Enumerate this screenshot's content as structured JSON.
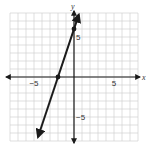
{
  "chart_data": {
    "type": "line",
    "title": "",
    "xlabel": "x",
    "ylabel": "y",
    "xlim": [
      -8,
      8
    ],
    "ylim": [
      -8,
      8
    ],
    "grid": true,
    "grid_step": 1,
    "x_tick_labels": [
      {
        "value": -5,
        "label": "−5"
      },
      {
        "value": 5,
        "label": "5"
      }
    ],
    "y_tick_labels": [
      {
        "value": 5,
        "label": "5"
      },
      {
        "value": -5,
        "label": "−5"
      }
    ],
    "series": [
      {
        "name": "line",
        "equation": "y = 3x + 6",
        "slope": 3,
        "intercept": 6,
        "x": [
          -4.5,
          -2,
          0,
          0.6
        ],
        "y": [
          -7.5,
          0,
          6,
          7.8
        ],
        "arrows_both_ends": true,
        "marked_points": [
          {
            "x": -2,
            "y": 0
          },
          {
            "x": 0,
            "y": 6
          }
        ]
      }
    ],
    "colors": {
      "line": "#1a1a1a",
      "axis": "#1a1a1a",
      "grid": "#c9c9c9"
    }
  }
}
